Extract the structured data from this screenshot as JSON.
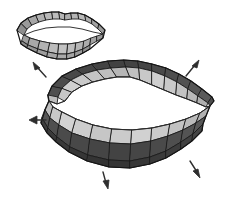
{
  "figure": {
    "background_color": "#ffffff",
    "width": 248,
    "height": 199,
    "palette": {
      "dark_facet": "#4a4a4a",
      "mid_facet": "#6d6d6d",
      "light_facet": "#c9c9c9",
      "pale_facet": "#dcdcdc",
      "shadow_facet": "#3a3a3a",
      "edge_stroke": "#1c1c1c",
      "arrow_color": "#2e2e2e",
      "background": "#ffffff"
    }
  },
  "objects": [
    {
      "id": "small-lip-mesh",
      "name": "small closed lip mesh",
      "description": "Small wireframe polygonal mouth model, closed lips, upper left",
      "bounds": {
        "x": 14,
        "y": 9,
        "width": 96,
        "height": 52
      },
      "state": "closed",
      "upper_lip_facets": 13,
      "lower_lip_facets": 11
    },
    {
      "id": "large-lip-mesh",
      "name": "large open lip mesh",
      "description": "Large shaded polygonal mouth model, lips parted, center lower",
      "bounds": {
        "x": 40,
        "y": 58,
        "width": 180,
        "height": 115
      },
      "state": "open",
      "upper_lip_facets": 14,
      "lower_lip_facets": 14
    }
  ],
  "arrows": [
    {
      "id": "arrow-up-left",
      "name": "arrow-up-left",
      "x": 40,
      "y": 70,
      "angle": -135,
      "length": 16
    },
    {
      "id": "arrow-up-right",
      "name": "arrow-up-right",
      "x": 193,
      "y": 68,
      "angle": -45,
      "length": 16
    },
    {
      "id": "arrow-left",
      "name": "arrow-left",
      "x": 36,
      "y": 121,
      "angle": 180,
      "length": 15
    },
    {
      "id": "arrow-down",
      "name": "arrow-down",
      "x": 106,
      "y": 182,
      "angle": 100,
      "length": 16
    },
    {
      "id": "arrow-down-right",
      "name": "arrow-down-right",
      "x": 196,
      "y": 171,
      "angle": 60,
      "length": 16
    }
  ]
}
